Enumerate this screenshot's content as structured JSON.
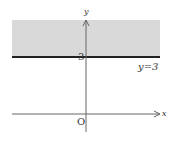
{
  "diagram": {
    "axes": {
      "x_label": "x",
      "y_label": "y",
      "origin_label": "O"
    },
    "line": {
      "equation_label": "y=3",
      "tick_label": "3",
      "value": 3
    },
    "colors": {
      "shade": "#d9d9d9",
      "line": "#222222",
      "axis": "#555555"
    }
  }
}
